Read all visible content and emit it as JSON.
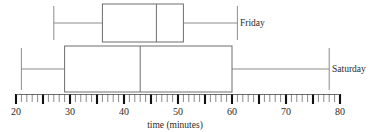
{
  "chart_data": {
    "type": "box",
    "title": "",
    "xlabel": "time (minutes)",
    "ylabel": "",
    "orientation": "horizontal",
    "xlim": [
      20,
      80
    ],
    "grid": false,
    "legend_position": "right-inline",
    "tick_labels": [
      "20",
      "30",
      "40",
      "50",
      "60",
      "70",
      "80"
    ],
    "tick_values": [
      20,
      30,
      40,
      50,
      60,
      70,
      80
    ],
    "minor_tick_step": 1,
    "major_tick_step": 5,
    "series": [
      {
        "name": "Friday",
        "min": 27,
        "q1": 36,
        "median": 46,
        "q3": 51,
        "max": 61
      },
      {
        "name": "Saturday",
        "min": 21,
        "q1": 29,
        "median": 43,
        "q3": 60,
        "max": 78
      }
    ]
  },
  "axis": {
    "label": "time (minutes)"
  },
  "colors": {
    "box_stroke": "#6e6e6e",
    "whisker_stroke": "#8c8c8c",
    "tick_major": "#111111",
    "tick_minor": "#8a8a8a",
    "text": "#2b2b2b",
    "background": "#ffffff"
  }
}
